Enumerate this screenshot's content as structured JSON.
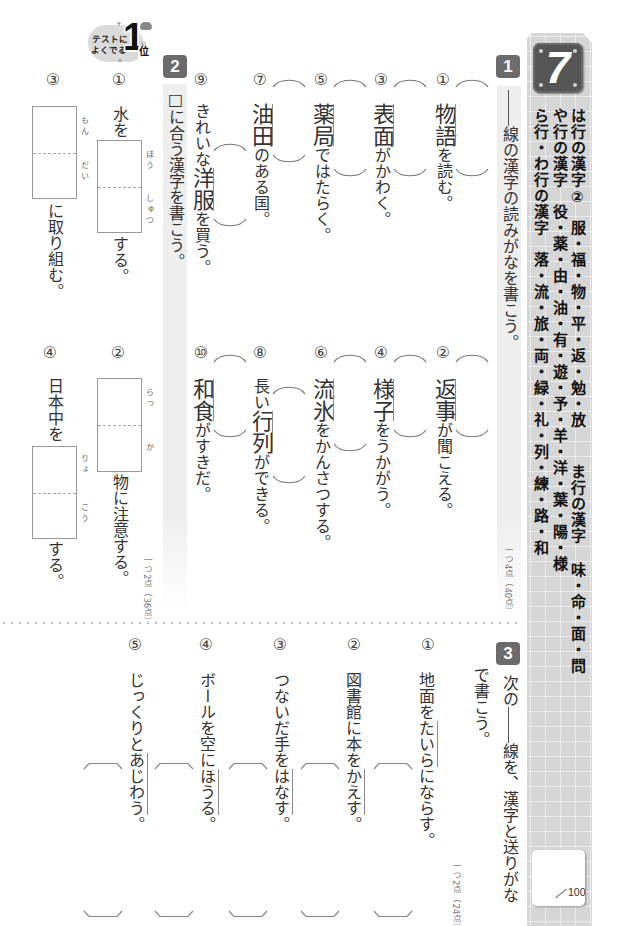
{
  "badge": {
    "line1": "テストに",
    "line2": "よくでる",
    "rank": "1",
    "rank_ruby": "い",
    "rank_suffix": "位"
  },
  "unit": {
    "number": "7",
    "columns": [
      [
        {
          "heading": "は行の漢字②",
          "kanji": "服・福・物・平・返・勉・放"
        },
        {
          "heading": "ま行の漢字",
          "kanji": "味・命・面・問"
        }
      ],
      [
        {
          "heading": "や行の漢字",
          "kanji": "役・薬・由・油・有・遊・予・羊・洋・葉・陽・様"
        }
      ],
      [
        {
          "heading": "ら行・わ行の漢字",
          "kanji": "落・流・旅・両・緑・礼・列・練・路・和"
        }
      ]
    ],
    "score": {
      "max": "100"
    }
  },
  "section1": {
    "number": "1",
    "instruction": "線の漢字の読みがなを書こう。",
    "points": "一つ4点（40点）",
    "items": [
      {
        "num": "①",
        "before": "",
        "target": "物語",
        "after": "を読む。"
      },
      {
        "num": "②",
        "before": "",
        "target": "返事",
        "after": "が聞こえる。"
      },
      {
        "num": "③",
        "before": "",
        "target": "表面",
        "after": "がかわく。"
      },
      {
        "num": "④",
        "before": "",
        "target": "様子",
        "after": "をうかがう。"
      },
      {
        "num": "⑤",
        "before": "",
        "target": "薬局",
        "after": "ではたらく。"
      },
      {
        "num": "⑥",
        "before": "",
        "target": "流氷",
        "after": "をかんさつする。"
      },
      {
        "num": "⑦",
        "before": "",
        "target": "油田",
        "after": "のある国。"
      },
      {
        "num": "⑧",
        "before": "長い",
        "target": "行列",
        "after": "ができる。"
      },
      {
        "num": "⑨",
        "before": "きれいな",
        "target": "洋服",
        "after": "を買う。"
      },
      {
        "num": "⑩",
        "before": "",
        "target": "和食",
        "after": "がすきだ。"
      }
    ]
  },
  "section2": {
    "number": "2",
    "instruction": "□に合う漢字を書こう。",
    "points": "一つ2点（36点）",
    "items": [
      {
        "num": "①",
        "before": "水を",
        "reading_top": "ほう",
        "reading_bottom": "しゅつ",
        "after": "する。"
      },
      {
        "num": "②",
        "before": "",
        "reading_top": "らっ",
        "reading_bottom": "か",
        "after": "物に注意する。"
      },
      {
        "num": "③",
        "before": "",
        "reading_top": "もん",
        "reading_bottom": "だい",
        "after": "に取り組む。"
      },
      {
        "num": "④",
        "before": "日本中を",
        "reading_top": "りょ",
        "reading_bottom": "こう",
        "after": "する。"
      }
    ]
  },
  "section3": {
    "number": "3",
    "instruction_a": "次の",
    "instruction_b": "線を、漢字と送りがな",
    "instruction_c": "で書こう。",
    "points": "一つ2点（24点）",
    "items": [
      {
        "num": "①",
        "before": "地面を",
        "target": "たいら",
        "after": "にならす。"
      },
      {
        "num": "②",
        "before": "図書館に本を",
        "target": "かえす",
        "after": "。"
      },
      {
        "num": "③",
        "before": "つないだ手を",
        "target": "はなす",
        "after": "。"
      },
      {
        "num": "④",
        "before": "ボールを空に",
        "target": "ほうる",
        "after": "。"
      },
      {
        "num": "⑤",
        "before": "じっくりと",
        "target": "あじわう",
        "after": "。"
      }
    ]
  },
  "colors": {
    "section_badge": "#6b6b6b",
    "sidebar": "#d6d6d6",
    "unit_badge": "#555555",
    "instruction_band": "#eeeeee"
  }
}
